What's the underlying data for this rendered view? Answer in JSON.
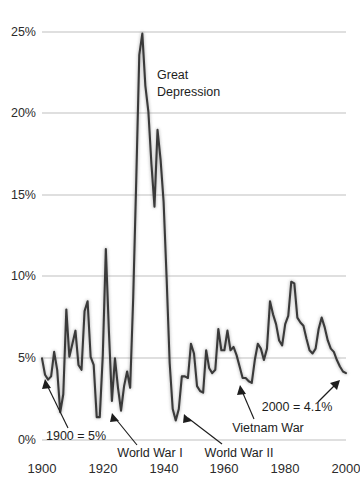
{
  "chart_data": {
    "type": "line",
    "title": "",
    "subtitle": "",
    "xlabel": "",
    "ylabel": "",
    "xlim": [
      1900,
      2000
    ],
    "ylim": [
      0,
      27
    ],
    "grid": true,
    "legend": null,
    "y_tick_labels": [
      "0%",
      "5%",
      "10%",
      "15%",
      "20%",
      "25%"
    ],
    "y_ticks": [
      0,
      5,
      10,
      15,
      20,
      25
    ],
    "x_tick_labels": [
      "1900",
      "1920",
      "1940",
      "1960",
      "1980",
      "2000"
    ],
    "x_ticks": [
      1900,
      1920,
      1940,
      1960,
      1980,
      2000
    ],
    "series": [
      {
        "name": "Unemployment rate",
        "x": [
          1900,
          1901,
          1902,
          1903,
          1904,
          1905,
          1906,
          1907,
          1908,
          1909,
          1910,
          1911,
          1912,
          1913,
          1914,
          1915,
          1916,
          1917,
          1918,
          1919,
          1920,
          1921,
          1922,
          1923,
          1924,
          1925,
          1926,
          1927,
          1928,
          1929,
          1930,
          1931,
          1932,
          1933,
          1934,
          1935,
          1936,
          1937,
          1938,
          1939,
          1940,
          1941,
          1942,
          1943,
          1944,
          1945,
          1946,
          1947,
          1948,
          1949,
          1950,
          1951,
          1952,
          1953,
          1954,
          1955,
          1956,
          1957,
          1958,
          1959,
          1960,
          1961,
          1962,
          1963,
          1964,
          1965,
          1966,
          1967,
          1968,
          1969,
          1970,
          1971,
          1972,
          1973,
          1974,
          1975,
          1976,
          1977,
          1978,
          1979,
          1980,
          1981,
          1982,
          1983,
          1984,
          1985,
          1986,
          1987,
          1988,
          1989,
          1990,
          1991,
          1992,
          1993,
          1994,
          1995,
          1996,
          1997,
          1998,
          1999,
          2000
        ],
        "values": [
          5.0,
          4.0,
          3.7,
          3.9,
          5.4,
          4.3,
          1.7,
          2.8,
          8.0,
          5.1,
          5.9,
          6.7,
          4.6,
          4.3,
          7.9,
          8.5,
          5.1,
          4.6,
          1.4,
          1.4,
          5.2,
          11.7,
          6.7,
          2.4,
          5.0,
          3.2,
          1.8,
          3.3,
          4.2,
          3.2,
          8.7,
          15.9,
          23.6,
          24.9,
          21.7,
          20.1,
          16.9,
          14.3,
          19.0,
          17.2,
          14.6,
          9.9,
          4.7,
          1.9,
          1.2,
          1.9,
          3.9,
          3.9,
          3.8,
          5.9,
          5.3,
          3.3,
          3.0,
          2.9,
          5.5,
          4.4,
          4.1,
          4.3,
          6.8,
          5.5,
          5.5,
          6.7,
          5.5,
          5.7,
          5.2,
          4.5,
          3.8,
          3.8,
          3.6,
          3.5,
          4.9,
          5.9,
          5.6,
          4.9,
          5.6,
          8.5,
          7.7,
          7.1,
          6.1,
          5.8,
          7.1,
          7.6,
          9.7,
          9.6,
          7.5,
          7.2,
          7.0,
          6.2,
          5.5,
          5.3,
          5.6,
          6.8,
          7.5,
          6.9,
          6.1,
          5.6,
          5.4,
          4.9,
          4.5,
          4.2,
          4.1
        ]
      }
    ],
    "annotations": [
      {
        "name": "great-depression",
        "text_lines": [
          "Great",
          "Depression"
        ]
      },
      {
        "name": "start-value",
        "text": "1900 = 5%"
      },
      {
        "name": "world-war-i",
        "text": "World War I"
      },
      {
        "name": "world-war-ii",
        "text": "World War II"
      },
      {
        "name": "vietnam-war",
        "text": "Vietnam War"
      },
      {
        "name": "end-value",
        "text": "2000 = 4.1%"
      }
    ],
    "colors": {
      "line": "#3a3a3a",
      "grid": "#b8b8b8",
      "text": "#1d1d1d",
      "background": "#ffffff"
    }
  },
  "labels": {
    "y": {
      "t0": "0%",
      "t5": "5%",
      "t10": "10%",
      "t15": "15%",
      "t20": "20%",
      "t25": "25%"
    },
    "x": {
      "t1900": "1900",
      "t1920": "1920",
      "t1940": "1940",
      "t1960": "1960",
      "t1980": "1980",
      "t2000": "2000"
    },
    "annotations": {
      "great_depression_1": "Great",
      "great_depression_2": "Depression",
      "start_value": "1900 = 5%",
      "world_war_i": "World War I",
      "world_war_ii": "World War II",
      "vietnam_war": "Vietnam War",
      "end_value": "2000 = 4.1%"
    }
  }
}
